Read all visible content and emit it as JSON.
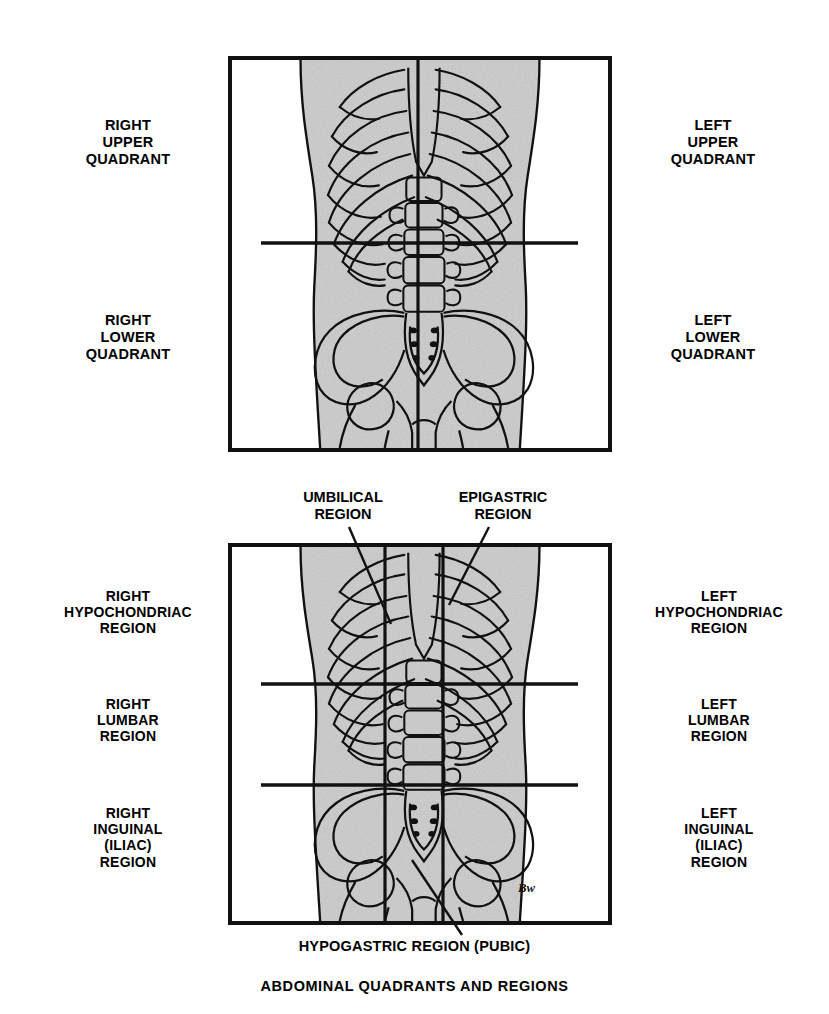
{
  "caption": "ABDOMINAL QUADRANTS AND REGIONS",
  "colors": {
    "ink": "#111111",
    "body_fill": "#bdbdbd",
    "background": "#ffffff"
  },
  "panels": [
    {
      "id": "quadrants",
      "name": "abdominal-quadrants",
      "divider_style": "one vertical midline and one horizontal line crossing at the umbilicus",
      "labels": [
        {
          "id": "right-upper-quadrant",
          "text": "RIGHT\nUPPER\nQUADRANT",
          "side": "left"
        },
        {
          "id": "left-upper-quadrant",
          "text": "LEFT\nUPPER\nQUADRANT",
          "side": "right"
        },
        {
          "id": "right-lower-quadrant",
          "text": "RIGHT\nLOWER\nQUADRANT",
          "side": "left"
        },
        {
          "id": "left-lower-quadrant",
          "text": "LEFT\nLOWER\nQUADRANT",
          "side": "right"
        }
      ]
    },
    {
      "id": "regions",
      "name": "abdominal-regions",
      "divider_style": "two vertical midclavicular lines and two horizontal lines forming nine regions",
      "labels": [
        {
          "id": "right-hypochondriac-region",
          "text": "RIGHT\nHYPOCHONDRIAC\nREGION",
          "side": "left"
        },
        {
          "id": "left-hypochondriac-region",
          "text": "LEFT\nHYPOCHONDRIAC\nREGION",
          "side": "right"
        },
        {
          "id": "right-lumbar-region",
          "text": "RIGHT\nLUMBAR\nREGION",
          "side": "left"
        },
        {
          "id": "left-lumbar-region",
          "text": "LEFT\nLUMBAR\nREGION",
          "side": "right"
        },
        {
          "id": "right-inguinal-region",
          "text": "RIGHT\nINGUINAL\n(ILIAC)\nREGION",
          "side": "left"
        },
        {
          "id": "left-inguinal-region",
          "text": "LEFT\nINGUINAL\n(ILIAC)\nREGION",
          "side": "right"
        }
      ],
      "annotations": [
        {
          "id": "umbilical-region",
          "text": "UMBILICAL\nREGION",
          "position": "above-left"
        },
        {
          "id": "epigastric-region",
          "text": "EPIGASTRIC\nREGION",
          "position": "above-right"
        },
        {
          "id": "hypogastric-region",
          "text": "HYPOGASTRIC REGION (PUBIC)",
          "position": "below"
        }
      ]
    }
  ],
  "signature": "Bw"
}
